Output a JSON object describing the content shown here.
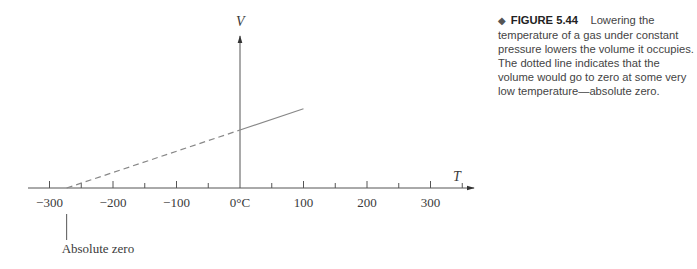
{
  "caption": {
    "marker": "◆",
    "figure_label": "FIGURE 5.44",
    "text": "Lowering the temperature of a gas under constant pressure lowers the volume it occupies. The dotted line indicates that the volume would go to zero at some very low temperature—absolute zero."
  },
  "chart_data": {
    "type": "line",
    "title": "",
    "xlabel": "T",
    "ylabel": "V",
    "x_ticks": [
      -300,
      -200,
      -100,
      0,
      100,
      200,
      300
    ],
    "x_tick_labels": [
      "−300",
      "−200",
      "−100",
      "0°C",
      "100",
      "200",
      "300"
    ],
    "xlim": [
      -320,
      370
    ],
    "grid": false,
    "series": [
      {
        "name": "measured",
        "style": "solid",
        "x": [
          0,
          100
        ],
        "y": [
          1.0,
          1.366
        ]
      },
      {
        "name": "extrapolated",
        "style": "dashed",
        "x": [
          -273,
          0
        ],
        "y": [
          0,
          1.0
        ]
      }
    ],
    "annotations": [
      {
        "text": "Absolute zero",
        "x": -273
      }
    ]
  }
}
